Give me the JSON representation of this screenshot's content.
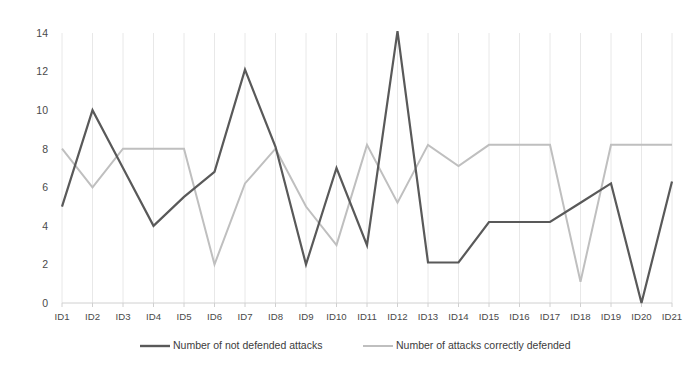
{
  "chart_data": {
    "type": "line",
    "title": "",
    "subtitle": "",
    "xlabel": "",
    "ylabel": "",
    "ylim": [
      0,
      14
    ],
    "xlim_categories": 21,
    "yticks": [
      0,
      2,
      4,
      6,
      8,
      10,
      12,
      14
    ],
    "ytick_labels": [
      "0",
      "2",
      "4",
      "6",
      "8",
      "10",
      "12",
      "14"
    ],
    "grid": "vertical-only",
    "legend_position": "bottom",
    "categories": [
      "ID1",
      "ID2",
      "ID3",
      "ID4",
      "ID5",
      "ID6",
      "ID7",
      "ID8",
      "ID9",
      "ID10",
      "ID11",
      "ID12",
      "ID13",
      "ID14",
      "ID15",
      "ID16",
      "ID17",
      "ID18",
      "ID19",
      "ID20",
      "ID21"
    ],
    "series": [
      {
        "name": "Number of not defended attacks",
        "color": "#595959",
        "values": [
          5,
          10,
          7,
          4,
          5.5,
          6.8,
          12.1,
          8.1,
          2,
          7,
          3,
          14.1,
          2.1,
          2.1,
          4.2,
          4.2,
          4.2,
          5.2,
          6.2,
          0,
          6.3
        ]
      },
      {
        "name": "Number of attacks correctly defended",
        "color": "#bfbfbf",
        "values": [
          8,
          6,
          8,
          8,
          8,
          2,
          6.2,
          8,
          5,
          3,
          8.2,
          5.2,
          8.2,
          7.1,
          8.2,
          8.2,
          8.2,
          1.1,
          8.2,
          8.2,
          8.2
        ]
      }
    ]
  },
  "legend": {
    "items": [
      {
        "label": "Number of not defended attacks",
        "color": "#595959"
      },
      {
        "label": "Number of attacks correctly defended",
        "color": "#bfbfbf"
      }
    ]
  },
  "colors": {
    "series_dark": "#595959",
    "series_light": "#bfbfbf",
    "gridline": "#e8e8e8",
    "axis": "#d0d0d0",
    "text": "#4a4a4a",
    "background": "#ffffff"
  }
}
